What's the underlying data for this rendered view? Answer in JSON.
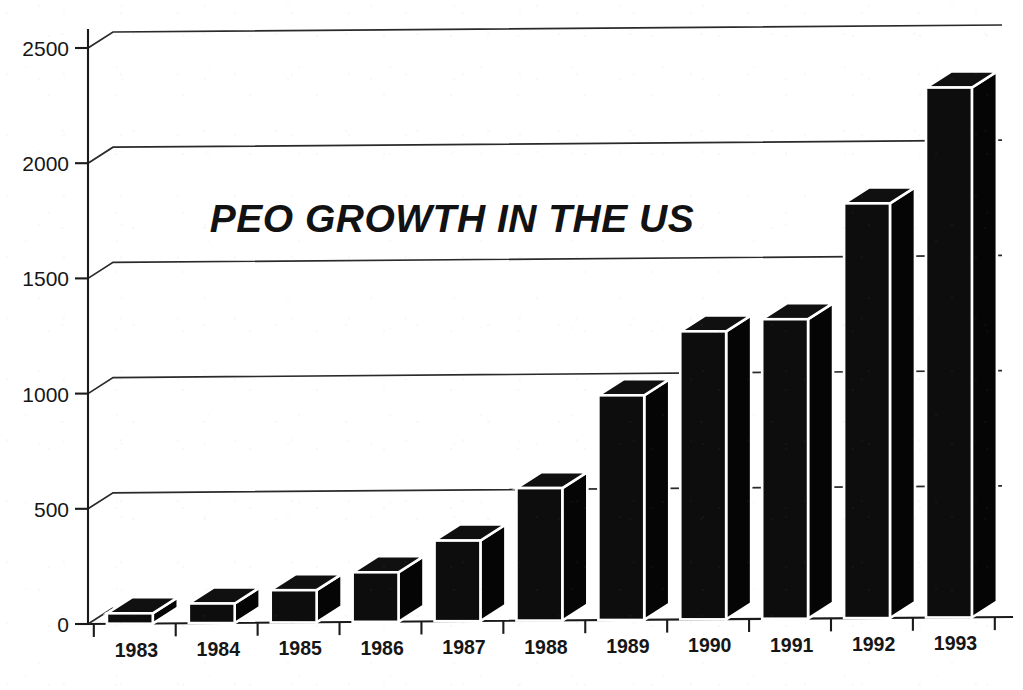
{
  "chart_data": {
    "type": "bar",
    "title": "PEO GROWTH IN THE US",
    "xlabel": "",
    "ylabel": "",
    "categories": [
      "1983",
      "1984",
      "1985",
      "1986",
      "1987",
      "1988",
      "1989",
      "1990",
      "1991",
      "1992",
      "1993"
    ],
    "values": [
      45,
      85,
      140,
      215,
      350,
      575,
      975,
      1250,
      1300,
      1800,
      2300
    ],
    "ylim": [
      0,
      2500
    ],
    "y_ticks": [
      "0",
      "500",
      "1000",
      "1500",
      "2000",
      "2500"
    ],
    "y_tick_values": [
      0,
      500,
      1000,
      1500,
      2000,
      2500
    ],
    "grid": true,
    "grid_axis": "y",
    "legend": "none",
    "style": "3d-bar",
    "bar_color": "#0d0d0d",
    "bar_edge_color": "#ffffff",
    "background_color": "#ffffff",
    "axis_color": "#1a1a1a"
  },
  "axes": {
    "y_axis_name": "y-axis",
    "x_axis_name": "x-axis"
  }
}
